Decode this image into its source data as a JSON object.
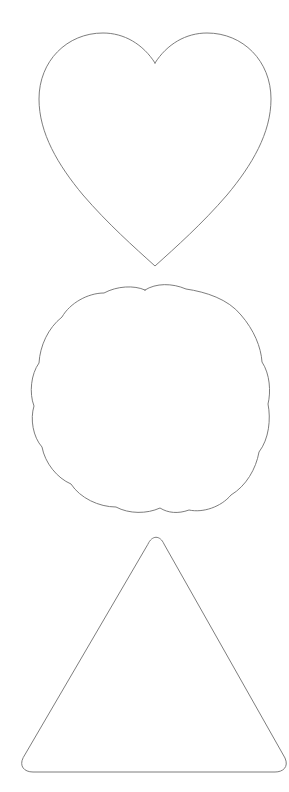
{
  "canvas": {
    "width": 289,
    "height": 792,
    "background_color": "#ffffff",
    "title": "Shape Outlines"
  },
  "style": {
    "stroke_color": "#666666",
    "stroke_width": 0.9,
    "fill": "none"
  },
  "shapes": [
    {
      "id": "heart",
      "name": "heart-shape",
      "label": "Heart",
      "order": 1,
      "stroke_color": "#6e6e6e",
      "stroke_width": 0.9,
      "fill": "none",
      "bounds": {
        "x": 38,
        "y": 33,
        "width": 235,
        "height": 233
      },
      "key_points": {
        "top_notch": [
          155,
          63
        ],
        "bottom_tip": [
          155,
          266
        ],
        "left_extreme": [
          38,
          97
        ],
        "right_extreme": [
          273,
          97
        ]
      },
      "path": "M 155 63 C 143 44 124 33 103 33 C 67 33 39 61 39 99 C 39 133 58 165 83 195 C 108 224 134 247 155 266 C 176 247 202 224 227 195 C 252 165 271 133 271 99 C 271 61 243 33 207 33 C 186 33 167 44 155 63 Z"
    },
    {
      "id": "scallop",
      "name": "scalloped-flower-shape",
      "label": "Scalloped flower",
      "order": 2,
      "lobe_count": 8,
      "stroke_color": "#6e6e6e",
      "stroke_width": 0.9,
      "fill": "none",
      "bounds": {
        "x": 35,
        "y": 287,
        "width": 235,
        "height": 225
      },
      "key_points": {
        "center": [
          152,
          399
        ],
        "top_notch": [
          145,
          290
        ],
        "left_notch": [
          36,
          408
        ],
        "right_notch": [
          268,
          400
        ],
        "bottom_notch": [
          165,
          509
        ]
      },
      "path": "M 145 290 C 156 283 172 283 186 289 C 206 292 228 299 241 315 C 254 330 261 347 262 362 C 270 374 271 392 268 404 C 271 419 269 439 259 452 C 256 469 246 486 231 495 C 221 507 203 513 189 510 C 178 514 168 513 160 508 C 147 514 129 514 116 507 C 99 507 80 498 71 484 C 57 478 45 463 42 447 C 33 437 30 419 34 406 C 29 393 31 374 39 363 C 40 346 48 328 62 317 C 70 303 88 293 104 293 C 117 286 134 285 145 290 Z"
    },
    {
      "id": "triangle",
      "name": "rounded-triangle-shape",
      "label": "Rounded triangle",
      "order": 3,
      "corner_radius": 14,
      "stroke_color": "#6e6e6e",
      "stroke_width": 0.9,
      "fill": "none",
      "bounds": {
        "x": 22,
        "y": 535,
        "width": 258,
        "height": 235
      },
      "key_points": {
        "apex": [
          155,
          535
        ],
        "bottom_left": [
          22,
          770
        ],
        "bottom_right": [
          280,
          770
        ]
      },
      "path": "M 148 544 C 152 535 160 535 164 544 L 285 758 C 289 767 283 772 275 772 L 33 772 C 24 772 19 766 23 758 Z"
    }
  ]
}
